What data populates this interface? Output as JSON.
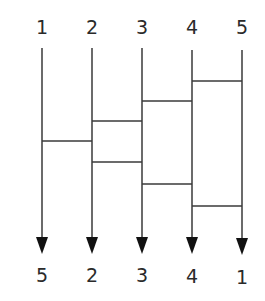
{
  "diagram": {
    "type": "amidakuji-ladder",
    "top_labels": [
      "1",
      "2",
      "3",
      "4",
      "5"
    ],
    "bottom_labels": [
      "5",
      "2",
      "3",
      "4",
      "1"
    ],
    "columns_x": [
      42,
      92,
      142,
      192,
      242
    ],
    "rungs": [
      {
        "from": 4,
        "to": 5,
        "y": 81
      },
      {
        "from": 3,
        "to": 4,
        "y": 101
      },
      {
        "from": 2,
        "to": 3,
        "y": 121
      },
      {
        "from": 1,
        "to": 2,
        "y": 141
      },
      {
        "from": 2,
        "to": 3,
        "y": 162
      },
      {
        "from": 3,
        "to": 4,
        "y": 184
      },
      {
        "from": 4,
        "to": 5,
        "y": 206
      }
    ],
    "colors": {
      "line": "#3a3a3a",
      "arrow": "#111111",
      "text": "#2a2a2a"
    }
  }
}
